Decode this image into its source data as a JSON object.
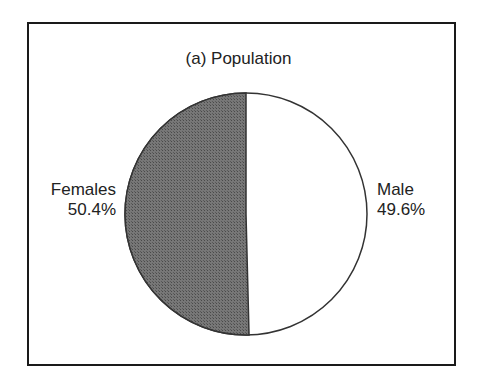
{
  "chart_data": {
    "type": "pie",
    "title": "(a) Population",
    "categories": [
      "Females",
      "Male"
    ],
    "values": [
      50.4,
      49.6
    ],
    "labels": [
      "50.4%",
      "49.6%"
    ],
    "colors": [
      "#6b6b6b",
      "#ffffff"
    ],
    "legend": "none (direct labels)"
  },
  "labels": {
    "females_name": "Females",
    "females_pct": "50.4%",
    "male_name": "Male",
    "male_pct": "49.6%"
  }
}
